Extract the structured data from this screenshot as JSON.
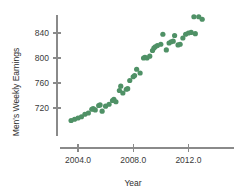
{
  "chart_data": {
    "type": "scatter",
    "title": "",
    "xlabel": "Year",
    "ylabel": "Men's Weekly Earnings",
    "xlim": [
      2003.0,
      2013.6
    ],
    "ylim": [
      694,
      878
    ],
    "grid": false,
    "legend": null,
    "marker_color": "#4f9166",
    "axis_color": "#8a8a8a",
    "xticks": [
      2004.0,
      2008.0,
      2012.0
    ],
    "xtick_labels": [
      "2004.0",
      "2008.0",
      "2012.0"
    ],
    "yticks": [
      720,
      760,
      800,
      840
    ],
    "ytick_labels": [
      "720",
      "760",
      "800",
      "840"
    ],
    "points": [
      {
        "x": 2003.5,
        "y": 700
      },
      {
        "x": 2003.75,
        "y": 702
      },
      {
        "x": 2004.0,
        "y": 704
      },
      {
        "x": 2004.25,
        "y": 706
      },
      {
        "x": 2004.5,
        "y": 710
      },
      {
        "x": 2004.75,
        "y": 712
      },
      {
        "x": 2005.0,
        "y": 718
      },
      {
        "x": 2005.1,
        "y": 719
      },
      {
        "x": 2005.25,
        "y": 717
      },
      {
        "x": 2005.5,
        "y": 724
      },
      {
        "x": 2005.6,
        "y": 725
      },
      {
        "x": 2005.75,
        "y": 715
      },
      {
        "x": 2006.0,
        "y": 723
      },
      {
        "x": 2006.25,
        "y": 726
      },
      {
        "x": 2006.5,
        "y": 732
      },
      {
        "x": 2006.6,
        "y": 734
      },
      {
        "x": 2006.75,
        "y": 730
      },
      {
        "x": 2007.0,
        "y": 748
      },
      {
        "x": 2007.1,
        "y": 755
      },
      {
        "x": 2007.25,
        "y": 744
      },
      {
        "x": 2007.5,
        "y": 750
      },
      {
        "x": 2007.6,
        "y": 751
      },
      {
        "x": 2007.75,
        "y": 764
      },
      {
        "x": 2008.0,
        "y": 770
      },
      {
        "x": 2008.1,
        "y": 772
      },
      {
        "x": 2008.25,
        "y": 782
      },
      {
        "x": 2008.5,
        "y": 776
      },
      {
        "x": 2008.75,
        "y": 800
      },
      {
        "x": 2008.85,
        "y": 801
      },
      {
        "x": 2009.0,
        "y": 800
      },
      {
        "x": 2009.2,
        "y": 803
      },
      {
        "x": 2009.4,
        "y": 812
      },
      {
        "x": 2009.5,
        "y": 816
      },
      {
        "x": 2009.6,
        "y": 818
      },
      {
        "x": 2009.75,
        "y": 820
      },
      {
        "x": 2010.0,
        "y": 822
      },
      {
        "x": 2010.15,
        "y": 838
      },
      {
        "x": 2010.4,
        "y": 813
      },
      {
        "x": 2010.6,
        "y": 824
      },
      {
        "x": 2010.75,
        "y": 826
      },
      {
        "x": 2010.9,
        "y": 827
      },
      {
        "x": 2011.0,
        "y": 836
      },
      {
        "x": 2011.25,
        "y": 821
      },
      {
        "x": 2011.4,
        "y": 822
      },
      {
        "x": 2011.6,
        "y": 832
      },
      {
        "x": 2011.8,
        "y": 838
      },
      {
        "x": 2012.0,
        "y": 840
      },
      {
        "x": 2012.2,
        "y": 841
      },
      {
        "x": 2012.4,
        "y": 866
      },
      {
        "x": 2012.5,
        "y": 839
      },
      {
        "x": 2012.75,
        "y": 866
      },
      {
        "x": 2013.0,
        "y": 862
      }
    ]
  },
  "geometry": {
    "plot_left": 57,
    "plot_right": 234,
    "axis_y": 148,
    "x_tick_px": [
      78,
      133.2,
      188.4
    ],
    "y_tick_px": [
      108,
      83,
      58,
      33
    ],
    "x_scale_px_per_unit": 13.8,
    "x_origin_year": 2004.0,
    "y_scale_px_per_unit": 0.625,
    "y_origin_value": 720,
    "y_origin_px": 108,
    "marker_radius": 2.6
  }
}
